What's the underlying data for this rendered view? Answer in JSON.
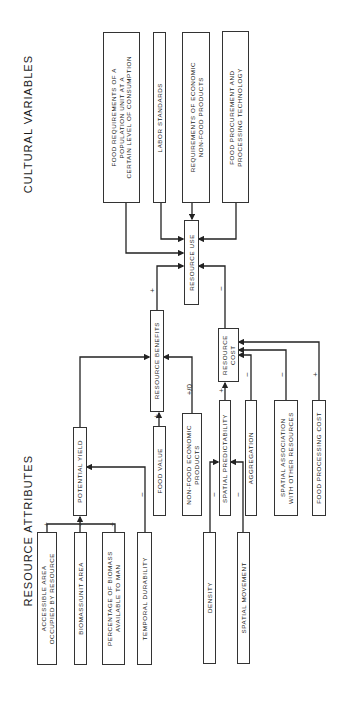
{
  "titles": {
    "cultural": "CULTURAL VARIABLES",
    "resource": "RESOURCE ATTRIBUTES"
  },
  "cultural_variables": [
    {
      "id": "food-requirements",
      "label": "FOOD REQUIREMENTS OF A\nPOPULATION UNIT AT A\nCERTAIN LEVEL OF CONSUMPTION"
    },
    {
      "id": "labor-standards",
      "label": "LABOR STANDARDS"
    },
    {
      "id": "economic-requirements",
      "label": "REQUIREMENTS OF ECONOMIC\nNON-FOOD PRODUCTS"
    },
    {
      "id": "food-procurement",
      "label": "FOOD PROCUREMENT AND\nPROCESSING TECHNOLOGY"
    }
  ],
  "central": {
    "resource_use": "RESOURCE USE",
    "resource_benefits": "RESOURCE BENEFITS",
    "resource_cost": "RESOURCE\nCOST",
    "potential_yield": "POTENTIAL YIELD"
  },
  "benefit_inputs": [
    {
      "id": "food-value",
      "label": "FOOD VALUE",
      "sign": "+"
    },
    {
      "id": "non-food-products",
      "label": "NON-FOOD ECONOMIC\nPRODUCTS",
      "sign": "+/0"
    }
  ],
  "cost_inputs": [
    {
      "id": "spatial-predictability",
      "label": "SPATIAL PREDICTABILITY",
      "sign": "+"
    },
    {
      "id": "aggregation",
      "label": "AGGREGATION",
      "sign": "−"
    },
    {
      "id": "spatial-association",
      "label": "SPATIAL ASSOCIATION\nWITH OTHER RESOURCES",
      "sign": "−"
    },
    {
      "id": "food-processing-cost",
      "label": "FOOD PROCESSING COST",
      "sign": "+"
    }
  ],
  "yield_inputs": [
    {
      "id": "accessible-area",
      "label": "ACCESSIBLE AREA\nOCCUPIED BY RESOURCE",
      "sign": "+"
    },
    {
      "id": "biomass-unit-area",
      "label": "BIOMASS/UNIT AREA",
      "sign": "+"
    },
    {
      "id": "percentage-biomass",
      "label": "PERCENTAGE OF BIOMASS\nAVAILABLE TO MAN",
      "sign": "+"
    },
    {
      "id": "temporal-durability",
      "label": "TEMPORAL DURABILITY",
      "sign": "−"
    }
  ],
  "predictability_inputs": [
    {
      "id": "density",
      "label": "DENSITY",
      "sign": "−"
    },
    {
      "id": "spatial-movement",
      "label": "SPATIAL MOVEMENT",
      "sign": "−"
    }
  ],
  "links": {
    "benefits_to_use": "+",
    "cost_to_use": "−"
  }
}
